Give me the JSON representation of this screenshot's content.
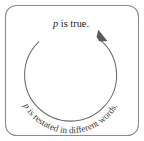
{
  "figure": {
    "type": "circular-reasoning-diagram",
    "top_label": {
      "variable": "p",
      "rest": " is true."
    },
    "curved_label": {
      "variable": "p",
      "rest": " is restated in different words."
    },
    "colors": {
      "background": "#ffffff",
      "frame_stroke": "#8c8c8c",
      "loop_stroke": "#6e6e6e",
      "arrow_fill": "#5a5a5a",
      "top_text": "#1d1d1d",
      "curved_text": "#3a3a3a"
    },
    "geometry": {
      "frame": {
        "x": 5,
        "y": 5,
        "width": 134,
        "height": 131,
        "radius": 11
      },
      "circle": {
        "cx": 70.5,
        "cy": 74,
        "r": 46
      },
      "arc_gap_degrees": 86,
      "arrow_direction": "clockwise"
    }
  }
}
